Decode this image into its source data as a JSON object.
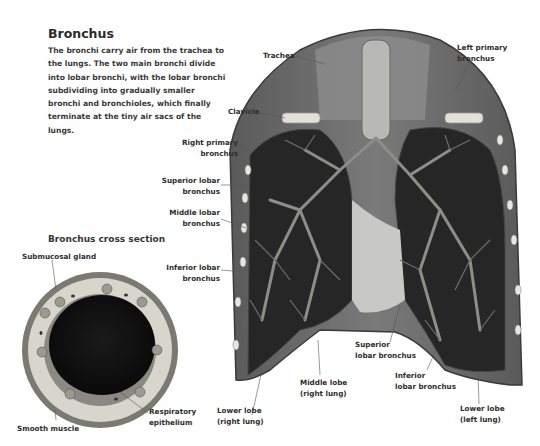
{
  "header": {
    "title": "Bronchus",
    "description": "The bronchi carry air from the trachea to the lungs. The two main bronchi divide into lobar bronchi, with the lobar bronchi subdividing into gradually smaller bronchi and bronchioles, which finally terminate at the tiny air sacs of the lungs."
  },
  "cross_section": {
    "title": "Bronchus cross section",
    "labels": {
      "submucosal_gland": "Submucosal gland",
      "smooth_muscle": "Smooth muscle",
      "respiratory_epithelium": "Respiratory\nepithelium"
    }
  },
  "lung_labels": {
    "trachea": "Trachea",
    "left_primary_bronchus": "Left primary\nbronchus",
    "clavicle": "Clavicle",
    "right_primary_bronchus": "Right primary\nbronchus",
    "superior_lobar_bronchus_right": "Superior lobar\nbronchus",
    "middle_lobar_bronchus": "Middle lobar\nbronchus",
    "inferior_lobar_bronchus_right": "Inferior lobar\nbronchus",
    "lower_lobe_right": "Lower lobe\n(right lung)",
    "middle_lobe_right": "Middle lobe\n(right lung)",
    "superior_lobar_bronchus_left": "Superior\nlobar bronchus",
    "inferior_lobar_bronchus_left": "Inferior\nlobar bronchus",
    "lower_lobe_left": "Lower lobe\n(left lung)"
  },
  "colors": {
    "background": "#ffffff",
    "text": "#2e2e2e",
    "lung_dark": "#2a2a2a",
    "bronchi": "#8a8a8a",
    "tissue": "#d8d6cc"
  }
}
